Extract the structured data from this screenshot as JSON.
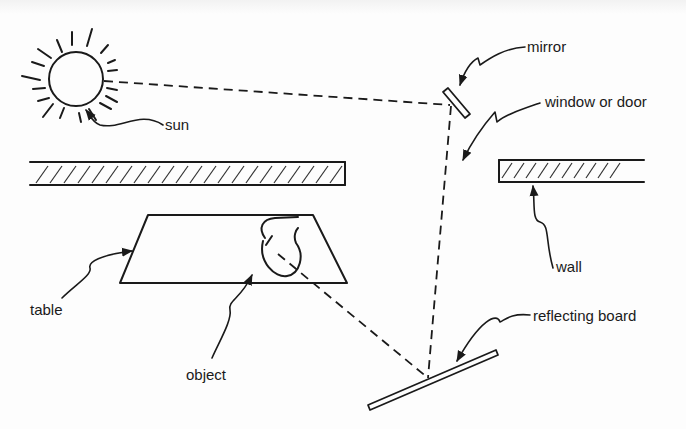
{
  "diagram": {
    "type": "light-reflection-setup",
    "labels": {
      "sun": "sun",
      "mirror": "mirror",
      "window": "window or door",
      "wall": "wall",
      "table": "table",
      "object": "object",
      "reflecting_board": "reflecting board"
    },
    "light_path": [
      "sun",
      "mirror",
      "reflecting board",
      "object"
    ],
    "colors": {
      "ink": "#1a1a1a",
      "paper": "#fdfdfd"
    }
  }
}
